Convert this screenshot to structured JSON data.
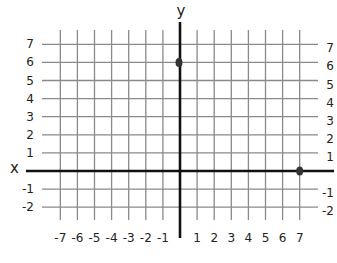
{
  "chart_data": {
    "type": "scatter",
    "title": "",
    "xlabel": "x",
    "ylabel": "y",
    "xlim": [
      -7,
      7
    ],
    "ylim": [
      -2,
      7
    ],
    "grid": true,
    "x_ticks": [
      -7,
      -6,
      -5,
      -4,
      -3,
      -2,
      -1,
      1,
      2,
      3,
      4,
      5,
      6,
      7
    ],
    "y_ticks": [
      7,
      6,
      5,
      4,
      3,
      2,
      1,
      -1,
      -2
    ],
    "points": [
      {
        "x": 0,
        "y": 6
      },
      {
        "x": 7,
        "y": 0
      }
    ]
  },
  "style": {
    "grid_color": "#8a8a8a",
    "axis_color": "#111111",
    "point_color": "#333333"
  },
  "geometry": {
    "origin_x": 180,
    "origin_y": 171,
    "unit_x": 17.1,
    "unit_y": 18.1,
    "grid_left": 42,
    "grid_right": 318,
    "grid_top": 30,
    "grid_bottom": 220,
    "xaxis_left": 26,
    "xaxis_right": 334,
    "yaxis_top": 22,
    "yaxis_bottom": 238
  }
}
